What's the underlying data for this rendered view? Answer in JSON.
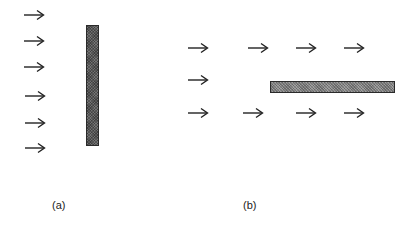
{
  "panels": [
    {
      "id": "a",
      "label": "(a)",
      "label_pos": {
        "x": 52,
        "y": 206
      },
      "arrows": [
        {
          "x": 23,
          "y": 15
        },
        {
          "x": 23,
          "y": 41
        },
        {
          "x": 23,
          "y": 67
        },
        {
          "x": 24,
          "y": 96
        },
        {
          "x": 24,
          "y": 123
        },
        {
          "x": 24,
          "y": 148
        }
      ],
      "bar": {
        "orientation": "vertical",
        "x": 86,
        "y": 25,
        "width": 13,
        "height": 121,
        "color": "#555555"
      }
    },
    {
      "id": "b",
      "label": "(b)",
      "label_pos": {
        "x": 243,
        "y": 206
      },
      "arrows": [
        {
          "x": 187,
          "y": 48
        },
        {
          "x": 247,
          "y": 48
        },
        {
          "x": 295,
          "y": 48
        },
        {
          "x": 343,
          "y": 48
        },
        {
          "x": 187,
          "y": 80
        },
        {
          "x": 187,
          "y": 113
        },
        {
          "x": 242,
          "y": 113
        },
        {
          "x": 295,
          "y": 113
        },
        {
          "x": 343,
          "y": 113
        }
      ],
      "bar": {
        "orientation": "horizontal",
        "x": 270,
        "y": 81,
        "width": 125,
        "height": 12,
        "color": "#8a8a8a"
      }
    }
  ],
  "icons": {
    "arrow": "right-arrow-icon"
  }
}
